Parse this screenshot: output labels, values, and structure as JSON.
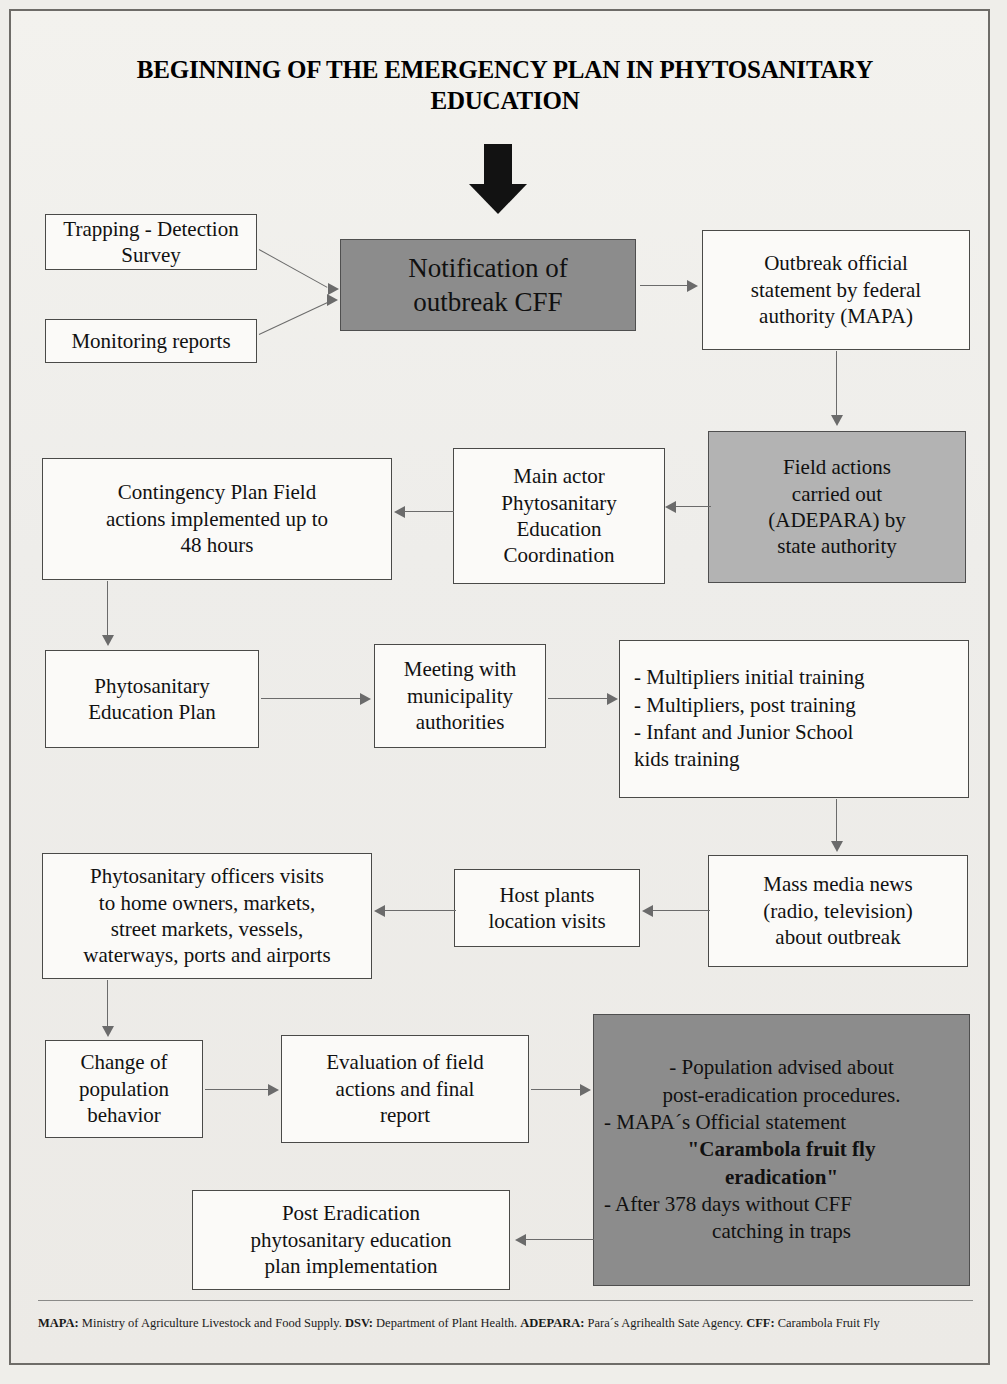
{
  "title": "BEGINNING OF THE EMERGENCY PLAN IN PHYTOSANITARY EDUCATION",
  "colors": {
    "page_background": "#efeeea",
    "box_fill": "#fbfaf8",
    "box_border": "#4a4a48",
    "gray_dark_fill": "#8c8c8c",
    "gray_light_fill": "#b3b3b3",
    "connector": "#6b6b6b",
    "text": "#111111"
  },
  "nodes": {
    "trapping": {
      "label": "Trapping  - Detection\nSurvey"
    },
    "monitoring": {
      "label": "Monitoring reports"
    },
    "notification": {
      "label": "Notification of\noutbreak  CFF",
      "fill": "gray-dark"
    },
    "outbreak_statement": {
      "label": "Outbreak official\nstatement  by federal\nauthority (MAPA)"
    },
    "field_actions": {
      "label": "Field actions\ncarried out\n(ADEPARA) by\nstate authority",
      "fill": "gray-light"
    },
    "main_actor": {
      "label": "Main actor\nPhytosanitary\nEducation\nCoordination"
    },
    "contingency": {
      "label": "Contingency Plan Field\nactions implemented up to\n48 hours"
    },
    "education_plan": {
      "label": "Phytosanitary\nEducation Plan"
    },
    "meeting": {
      "label": "Meeting  with\nmunicipality\nauthorities"
    },
    "training": {
      "lines": [
        "- Multipliers initial training",
        "- Multipliers, post  training",
        "- Infant and Junior School",
        "kids  training"
      ]
    },
    "mass_media": {
      "label": "Mass media news\n(radio, television)\nabout outbreak"
    },
    "host_plants": {
      "label": "Host plants\nlocation visits"
    },
    "officers_visits": {
      "label": "Phytosanitary officers visits\nto home owners, markets,\nstreet markets, vessels,\nwaterways, ports and airports"
    },
    "behavior_change": {
      "label": "Change of\npopulation\nbehavior"
    },
    "evaluation": {
      "label": "Evaluation of field\nactions and final\nreport"
    },
    "population_advised": {
      "fill": "gray-dark",
      "lines": [
        "- Population advised about",
        "post-eradication procedures.",
        "- MAPA´s Official  statement"
      ],
      "quote_line_1": "\"Carambola fruit fly",
      "quote_line_2": "eradication\"",
      "lines_after": [
        "- After 378 days without CFF",
        "catching in traps"
      ]
    },
    "post_eradication": {
      "label": "Post Eradication\nphytosanitary education\nplan implementation"
    }
  },
  "footer": {
    "mapa_key": "MAPA:",
    "mapa_text": " Ministry of  Agriculture Livestock and  Food Supply. ",
    "dsv_key": "DSV:",
    "dsv_text": "  Department of Plant Health. ",
    "adepara_key": "ADEPARA:",
    "adepara_text": "  Para´s Agrihealth Sate Agency. ",
    "cff_key": "CFF:",
    "cff_text": " Carambola Fruit Fly"
  }
}
